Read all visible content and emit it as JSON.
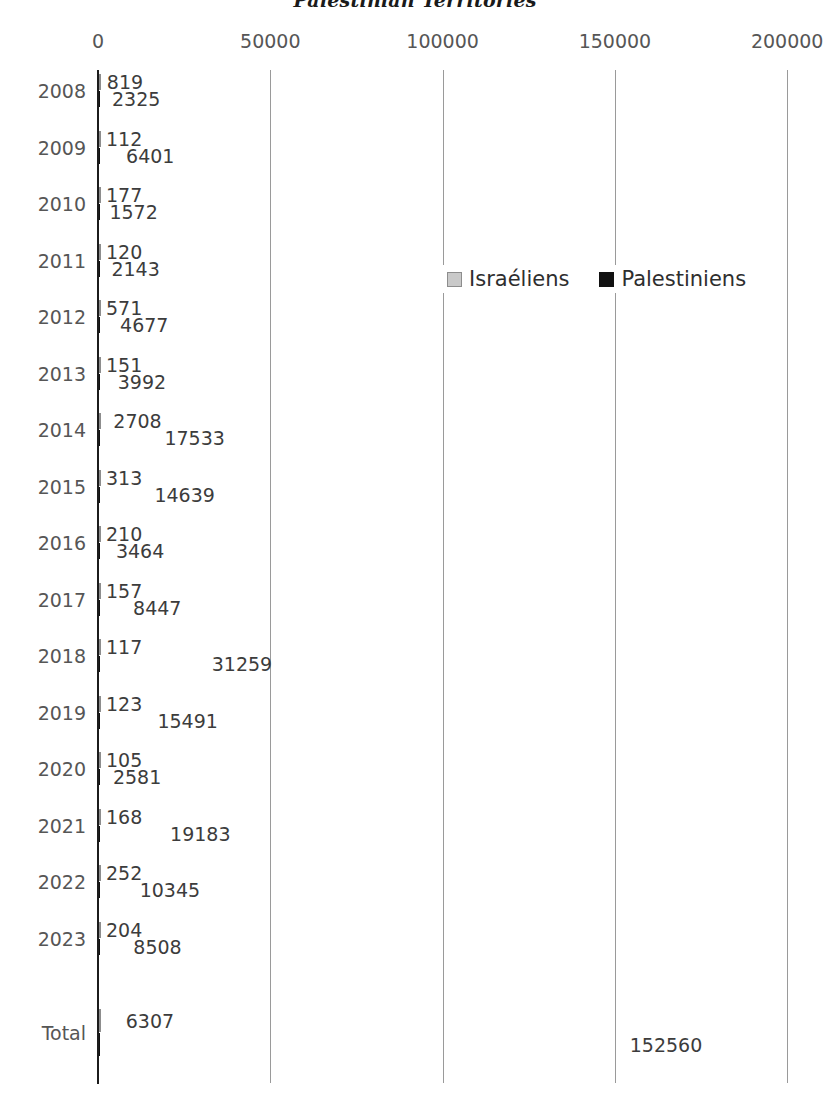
{
  "chart_data": {
    "type": "bar",
    "orientation": "horizontal",
    "title": "Palestinian Territories",
    "xlabel": "",
    "ylabel": "",
    "xlim": [
      0,
      200000
    ],
    "xticks": [
      "0",
      "50000",
      "100000",
      "150000",
      "200000"
    ],
    "xtick_values": [
      0,
      50000,
      100000,
      150000,
      200000
    ],
    "grid": true,
    "legend_position": "middle-right",
    "categories": [
      "2008",
      "2009",
      "2010",
      "2011",
      "2012",
      "2013",
      "2014",
      "2015",
      "2016",
      "2017",
      "2018",
      "2019",
      "2020",
      "2021",
      "2022",
      "2023",
      "Total"
    ],
    "series": [
      {
        "name": "Israéliens",
        "color": "#c9c9c9",
        "values": [
          819,
          112,
          177,
          120,
          571,
          151,
          2708,
          313,
          210,
          157,
          117,
          123,
          105,
          168,
          252,
          204,
          6307
        ]
      },
      {
        "name": "Palestiniens",
        "color": "#111111",
        "values": [
          2325,
          6401,
          1572,
          2143,
          4677,
          3992,
          17533,
          14639,
          3464,
          8447,
          31259,
          15491,
          2581,
          19183,
          10345,
          8508,
          152560
        ]
      }
    ]
  },
  "legend": {
    "items": [
      {
        "label": "Israéliens",
        "swatch": "israeli"
      },
      {
        "label": "Palestiniens",
        "swatch": "palestinian"
      }
    ]
  }
}
